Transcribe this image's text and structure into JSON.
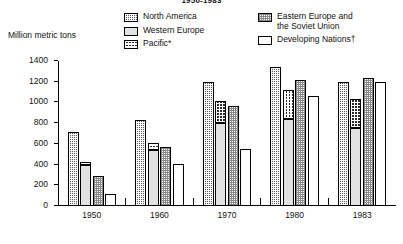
{
  "chart": {
    "title": "1950-1983",
    "ylabel": "Million metric tons",
    "footnote_markers": {
      "pacific": "*",
      "developing": "†"
    }
  },
  "legend": {
    "column1": [
      {
        "key": "north_america",
        "label": "North America",
        "swatch": "checker-dark-swatch"
      },
      {
        "key": "western_europe",
        "label": "Western Europe",
        "swatch": "light-gray-swatch"
      },
      {
        "key": "pacific",
        "label": "Pacific*",
        "swatch": "checker-bold-swatch"
      }
    ],
    "column2": [
      {
        "key": "eastern_europe",
        "label": "Eastern Europe and\nthe Soviet Union",
        "swatch": "dotted-swatch"
      },
      {
        "key": "developing",
        "label": "Developing Nations†",
        "swatch": "white-swatch"
      }
    ]
  },
  "chart_data": {
    "type": "bar",
    "title": "1950-1983",
    "xlabel": "",
    "ylabel": "Million metric tons",
    "ylim": [
      0,
      1400
    ],
    "yticks": [
      0,
      200,
      400,
      600,
      800,
      1000,
      1200,
      1400
    ],
    "ytick_labels": [
      "0",
      "200",
      "400",
      "600",
      "800",
      "1000",
      "1200",
      "1400"
    ],
    "grid": false,
    "legend_position": "top",
    "categories": [
      "1950",
      "1960",
      "1970",
      "1980",
      "1983"
    ],
    "note": "Within each year group the second bar is stacked: Western Europe at the base with Pacific on top.",
    "series": [
      {
        "name": "North America",
        "values": [
          710,
          835,
          1195,
          1340,
          1195
        ]
      },
      {
        "name": "Western Europe",
        "values": [
          395,
          545,
          800,
          840,
          755
        ]
      },
      {
        "name": "Pacific",
        "values": [
          30,
          65,
          210,
          280,
          275
        ]
      },
      {
        "name": "Western Europe + Pacific (bar total)",
        "values": [
          425,
          610,
          1010,
          1120,
          1030
        ]
      },
      {
        "name": "Eastern Europe and the Soviet Union",
        "values": [
          290,
          565,
          970,
          1215,
          1240
        ]
      },
      {
        "name": "Developing Nations",
        "values": [
          115,
          410,
          550,
          1060,
          1200
        ]
      }
    ]
  }
}
